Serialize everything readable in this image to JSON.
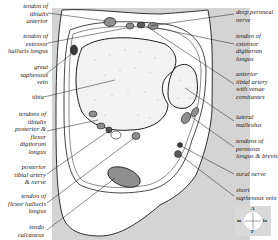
{
  "diagram": {
    "type": "anatomical cross-section",
    "colors": {
      "background_panel": "#d4d4d4",
      "bone_fill": "#f2f2f2",
      "tendon_fill": "#8f8f8f",
      "outline": "#1a1a1a",
      "text": "#222222"
    },
    "labels_left": [
      {
        "id": "tibialis-anterior",
        "text": "tendon of\ntibialis\nanterior"
      },
      {
        "id": "extensor-hallucis-longus",
        "text": "tendon of\nextensor\nhallucis longus"
      },
      {
        "id": "great-saphenous-vein",
        "text": "great\nsaphenous\nvein"
      },
      {
        "id": "tibia",
        "text": "tibia"
      },
      {
        "id": "tibialis-posterior-fdl",
        "text": "tendons of\ntibialis\nposterior &\nflexor\ndigitorum\nlongus"
      },
      {
        "id": "posterior-tibial-artery-nerve",
        "text": "posterior\ntibial artery\n& nerve"
      },
      {
        "id": "flexor-hallucis-longus",
        "text": "tendon of\nflexor hallucis\nlongus"
      },
      {
        "id": "tendo-calcaneus",
        "text": "tendo\ncalcaneus"
      }
    ],
    "labels_right": [
      {
        "id": "deep-peroneal-nerve",
        "text": "deep peroneal\nnerve"
      },
      {
        "id": "extensor-digitorum-longus",
        "text": "tendon of\nextensor\ndigitorum\nlongus"
      },
      {
        "id": "anterior-tibial-artery",
        "text": "anterior\ntibial artery\nwith venae\ncomitantes"
      },
      {
        "id": "lateral-malleolus",
        "text": "lateral\nmalleolus"
      },
      {
        "id": "peroneus-tendons",
        "text": "tendons of\nperoneus\nlongus & brevis"
      },
      {
        "id": "sural-nerve",
        "text": "sural nerve"
      },
      {
        "id": "short-saphenous-vein",
        "text": "short\nsaphenous vein"
      }
    ],
    "compass": {
      "top": "A",
      "bottom": "P",
      "left": "m",
      "right": "la"
    }
  }
}
